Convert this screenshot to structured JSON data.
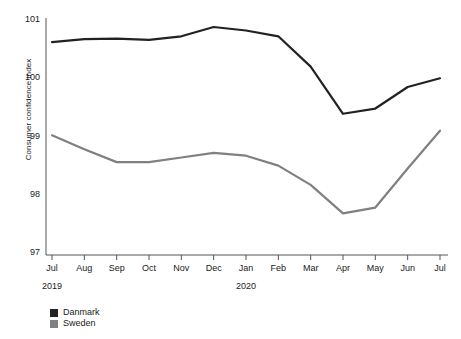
{
  "chart_data": {
    "type": "line",
    "title": "",
    "xlabel": "",
    "ylabel": "Consumer confidence index",
    "ylim": [
      97,
      101
    ],
    "yticks": [
      97,
      98,
      99,
      100,
      101
    ],
    "ytick_labels": [
      "97",
      "98",
      "99",
      "100",
      "101"
    ],
    "grid": false,
    "legend_position": "bottom-left",
    "categories": [
      "Jul",
      "Aug",
      "Sep",
      "Oct",
      "Nov",
      "Dec",
      "Jan",
      "Feb",
      "Mar",
      "Apr",
      "May",
      "Jun",
      "Jul"
    ],
    "period_labels": [
      {
        "text": "2019",
        "at_category": "Jul"
      },
      {
        "text": "2020",
        "at_category": "Jan"
      }
    ],
    "series": [
      {
        "name": "Danmark",
        "color": "#222222",
        "values": [
          100.62,
          100.67,
          100.68,
          100.66,
          100.72,
          100.88,
          100.82,
          100.72,
          100.2,
          99.39,
          99.48,
          99.85,
          100.0
        ]
      },
      {
        "name": "Sweden",
        "color": "#808080",
        "values": [
          99.02,
          98.78,
          98.56,
          98.56,
          98.64,
          98.72,
          98.67,
          98.5,
          98.17,
          97.68,
          97.78,
          98.45,
          99.1
        ]
      }
    ]
  },
  "legend": {
    "items": [
      {
        "label": "Danmark",
        "color": "#222222"
      },
      {
        "label": "Sweden",
        "color": "#808080"
      }
    ]
  }
}
